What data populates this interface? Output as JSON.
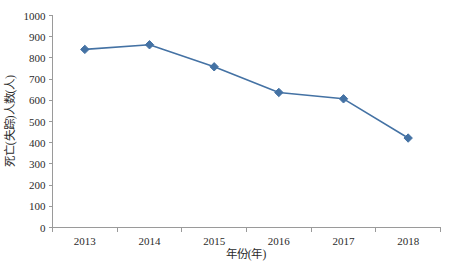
{
  "chart_data": {
    "type": "line",
    "title": "",
    "xlabel": "年份(年)",
    "ylabel": "死亡(失踪)人数(人)",
    "categories": [
      "2013",
      "2014",
      "2015",
      "2016",
      "2017",
      "2018"
    ],
    "values": [
      840,
      862,
      758,
      637,
      607,
      422
    ],
    "series": [
      {
        "name": "死亡(失踪)人数",
        "values": [
          840,
          862,
          758,
          637,
          607,
          422
        ],
        "color": "#4472A4",
        "marker": "diamond"
      }
    ],
    "ylim": [
      0,
      1000
    ],
    "y_ticks": [
      0,
      100,
      200,
      300,
      400,
      500,
      600,
      700,
      800,
      900,
      1000
    ],
    "y_tick_labels": [
      "0",
      "100",
      "200",
      "300",
      "400",
      "500",
      "600",
      "700",
      "800",
      "900",
      "1000"
    ],
    "x_tick_labels": [
      "2013",
      "2014",
      "2015",
      "2016",
      "2017",
      "2018"
    ],
    "grid": false,
    "legend": false,
    "legend_position": "none",
    "background_color": "#FFFFFF",
    "axis_color": "#9A9A9A"
  },
  "axes": {
    "y_title": "死亡(失踪)人数(人)",
    "x_title": "年份(年)"
  },
  "caption": {
    "ghost_text": ""
  }
}
